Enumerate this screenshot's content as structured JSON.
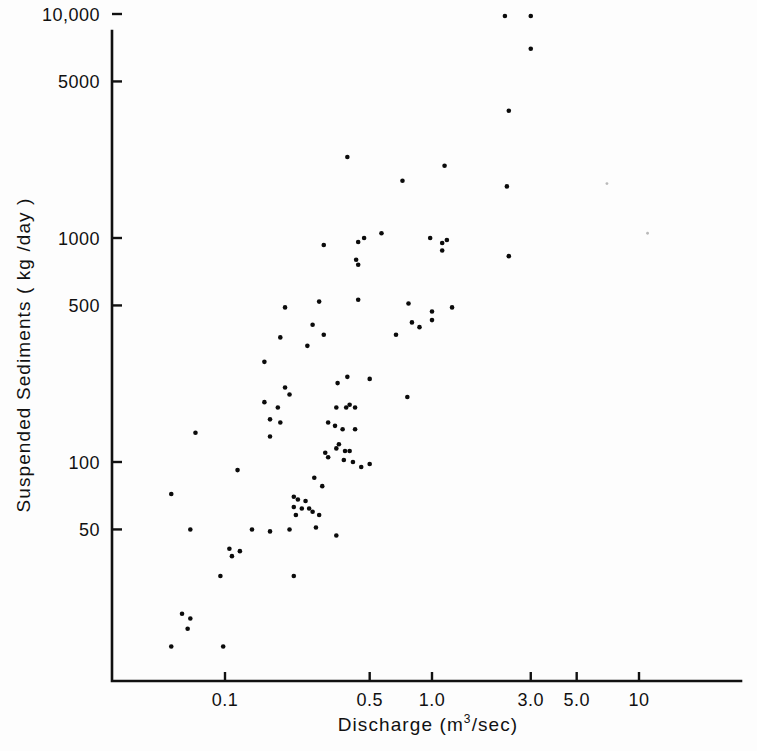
{
  "figure": {
    "background_color": "#fdfdfd",
    "ink_color": "#0b0b0b"
  },
  "chart_data": {
    "type": "scatter",
    "title": "",
    "xlabel": "Discharge  (m3/sec)",
    "xlabel_base": "Discharge  (m",
    "xlabel_exponent": "3",
    "xlabel_tail": "/sec)",
    "ylabel": "Suspended Sediments  (kg/day)",
    "ylabel_base": "Suspended Sediments  ( kg /day )",
    "xscale": "log",
    "yscale": "log",
    "xlim": [
      0.045,
      18.5
    ],
    "ylim": [
      14,
      10000
    ],
    "grid": false,
    "legend": null,
    "xticks": [
      0.1,
      0.5,
      1.0,
      3.0,
      5.0,
      10
    ],
    "xticklabels": [
      "0.1",
      "0.5",
      "1.0",
      "3.0",
      "5.0",
      "10"
    ],
    "yticks": [
      50,
      100,
      500,
      1000,
      5000,
      10000
    ],
    "yticklabels": [
      "50",
      "100",
      "500",
      "1000",
      "5000",
      "10,000"
    ],
    "marker": "filled-circle",
    "marker_size_px": 4.6,
    "n_points": 92,
    "points": [
      [
        2.25,
        9800
      ],
      [
        3.0,
        9800
      ],
      [
        3.0,
        7000
      ],
      [
        2.35,
        3700
      ],
      [
        0.39,
        2300
      ],
      [
        1.15,
        2100
      ],
      [
        0.72,
        1800
      ],
      [
        2.3,
        1700
      ],
      [
        0.3,
        930
      ],
      [
        0.44,
        960
      ],
      [
        0.47,
        1000
      ],
      [
        0.57,
        1050
      ],
      [
        0.98,
        1000
      ],
      [
        1.12,
        950
      ],
      [
        1.12,
        880
      ],
      [
        1.18,
        980
      ],
      [
        0.43,
        800
      ],
      [
        0.44,
        760
      ],
      [
        2.35,
        830
      ],
      [
        0.285,
        520
      ],
      [
        0.44,
        530
      ],
      [
        0.195,
        490
      ],
      [
        0.77,
        510
      ],
      [
        1.25,
        490
      ],
      [
        1.0,
        470
      ],
      [
        0.8,
        420
      ],
      [
        0.87,
        400
      ],
      [
        1.0,
        430
      ],
      [
        0.265,
        410
      ],
      [
        0.185,
        360
      ],
      [
        0.3,
        370
      ],
      [
        0.67,
        370
      ],
      [
        0.25,
        330
      ],
      [
        0.155,
        280
      ],
      [
        0.39,
        240
      ],
      [
        0.5,
        235
      ],
      [
        0.35,
        225
      ],
      [
        0.195,
        215
      ],
      [
        0.205,
        200
      ],
      [
        0.76,
        195
      ],
      [
        0.155,
        185
      ],
      [
        0.18,
        175
      ],
      [
        0.345,
        175
      ],
      [
        0.4,
        180
      ],
      [
        0.385,
        175
      ],
      [
        0.425,
        175
      ],
      [
        0.165,
        155
      ],
      [
        0.185,
        150
      ],
      [
        0.315,
        150
      ],
      [
        0.34,
        145
      ],
      [
        0.37,
        140
      ],
      [
        0.425,
        140
      ],
      [
        0.072,
        135
      ],
      [
        0.165,
        130
      ],
      [
        0.355,
        120
      ],
      [
        0.345,
        115
      ],
      [
        0.38,
        112
      ],
      [
        0.4,
        112
      ],
      [
        0.305,
        110
      ],
      [
        0.315,
        105
      ],
      [
        0.375,
        102
      ],
      [
        0.415,
        100
      ],
      [
        0.455,
        95
      ],
      [
        0.5,
        98
      ],
      [
        0.115,
        92
      ],
      [
        0.27,
        85
      ],
      [
        0.295,
        78
      ],
      [
        0.055,
        72
      ],
      [
        0.215,
        70
      ],
      [
        0.225,
        68
      ],
      [
        0.245,
        67
      ],
      [
        0.215,
        63
      ],
      [
        0.235,
        62
      ],
      [
        0.255,
        62
      ],
      [
        0.265,
        60
      ],
      [
        0.22,
        58
      ],
      [
        0.285,
        58
      ],
      [
        0.068,
        50
      ],
      [
        0.135,
        50
      ],
      [
        0.165,
        49
      ],
      [
        0.205,
        50
      ],
      [
        0.275,
        51
      ],
      [
        0.345,
        47
      ],
      [
        0.105,
        41
      ],
      [
        0.118,
        40
      ],
      [
        0.108,
        38
      ],
      [
        0.095,
        31
      ],
      [
        0.215,
        31
      ],
      [
        0.062,
        21
      ],
      [
        0.068,
        20
      ],
      [
        0.066,
        18
      ],
      [
        0.055,
        15
      ],
      [
        0.098,
        15
      ]
    ],
    "specks": [
      [
        7.0,
        1750
      ],
      [
        11.0,
        1050
      ]
    ]
  },
  "geometry": {
    "axis_origin_x_px": 112,
    "axis_origin_y_px": 681,
    "axis_top_y_px": 31,
    "axis_right_x_px": 741,
    "px_per_decade_x": 207,
    "px_per_decade_y": 224,
    "x_ref_value": 0.1,
    "x_ref_px": 225,
    "y_ref_value": 100,
    "y_ref_px": 462
  }
}
